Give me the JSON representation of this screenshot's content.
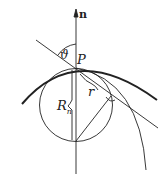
{
  "labels": {
    "normal": "n",
    "angle": "ϑ",
    "point": "P",
    "radius_small": "r",
    "radius_normal": "R",
    "radius_normal_sub": "n"
  },
  "colors": {
    "stroke": "#222222",
    "background": "#ffffff"
  }
}
